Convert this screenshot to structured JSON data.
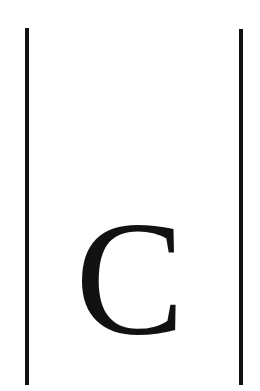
{
  "content": {
    "letter": "C",
    "left_delimiter": "|",
    "right_delimiter": "|"
  },
  "colors": {
    "ink": "#111111",
    "background": "#ffffff"
  }
}
